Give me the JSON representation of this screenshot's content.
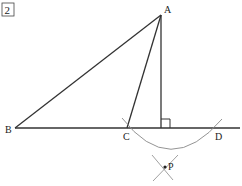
{
  "problem": {
    "number": "2"
  },
  "points": {
    "A": {
      "label": "A",
      "x": 161,
      "y": 15
    },
    "B": {
      "label": "B",
      "x": 15,
      "y": 128
    },
    "C": {
      "label": "C",
      "x": 127,
      "y": 128
    },
    "D": {
      "label": "D",
      "x": 216,
      "y": 128
    },
    "H": {
      "label": "",
      "x": 161,
      "y": 128
    },
    "P": {
      "label": "P",
      "x": 165,
      "y": 167
    }
  },
  "colors": {
    "line": "#333333",
    "arc": "#888888"
  }
}
